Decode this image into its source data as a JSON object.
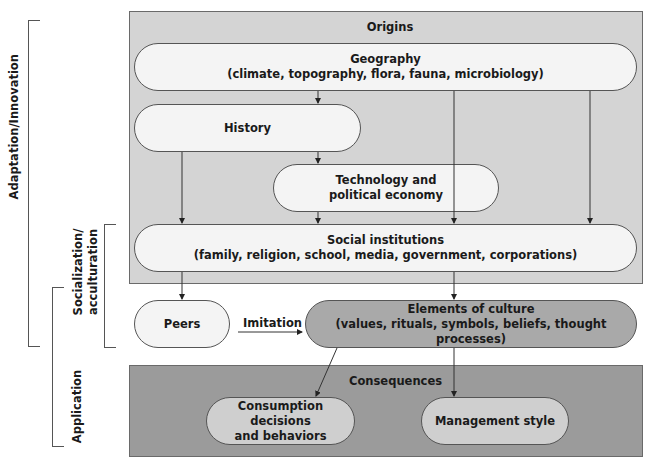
{
  "side_labels": {
    "adaptation": "Adaptation/Innovation",
    "socialization": [
      "Socialization/",
      "acculturation"
    ],
    "application": "Application"
  },
  "origins_panel": {
    "title": "Origins",
    "fill": "#d4d4d4",
    "nodes": {
      "geography": {
        "title": "Geography",
        "subtitle": "(climate, topography, flora, fauna, microbiology)"
      },
      "history": {
        "title": "History"
      },
      "technology": {
        "title": "Technology and",
        "subtitle": "political economy"
      },
      "social": {
        "title": "Social institutions",
        "subtitle": "(family, religion, school, media, government, corporations)"
      }
    }
  },
  "middle": {
    "peers": {
      "title": "Peers"
    },
    "imitation_label": "Imitation",
    "elements": {
      "title": "Elements of culture",
      "subtitle": "(values, rituals, symbols, beliefs, thought processes)"
    }
  },
  "consequences_panel": {
    "title": "Consequences",
    "fill": "#9b9b9b",
    "nodes": {
      "consumption": {
        "title": "Consumption decisions",
        "subtitle": "and behaviors"
      },
      "management": {
        "title": "Management style"
      }
    }
  },
  "edges": [
    [
      "geography",
      "technology"
    ],
    [
      "geography",
      "social"
    ],
    [
      "history",
      "technology"
    ],
    [
      "history",
      "social"
    ],
    [
      "technology",
      "social"
    ],
    [
      "social",
      "peers"
    ],
    [
      "social",
      "elements"
    ],
    [
      "peers",
      "elements"
    ],
    [
      "elements",
      "consumption"
    ],
    [
      "elements",
      "management"
    ]
  ]
}
